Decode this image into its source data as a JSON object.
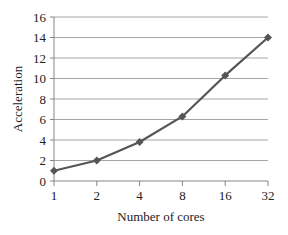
{
  "chart_data": {
    "type": "line",
    "title": "",
    "xlabel": "Number of cores",
    "ylabel": "Acceleration",
    "categories": [
      "1",
      "2",
      "4",
      "8",
      "16",
      "32"
    ],
    "series": [
      {
        "name": "Acceleration",
        "values": [
          1,
          2,
          3.8,
          6.3,
          10.3,
          14
        ],
        "color": "#555555",
        "marker": "diamond"
      }
    ],
    "ylim": [
      0,
      16
    ],
    "yticks": [
      0,
      2,
      4,
      6,
      8,
      10,
      12,
      14,
      16
    ],
    "grid": true,
    "legend": "none"
  }
}
